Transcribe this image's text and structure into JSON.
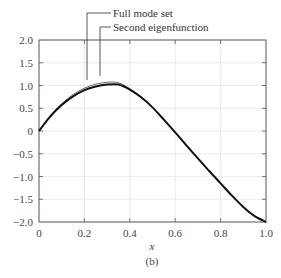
{
  "chart_data": {
    "type": "line",
    "title": "",
    "xlabel": "x",
    "ylabel": "",
    "caption": "(b)",
    "xlim": [
      0,
      1.0
    ],
    "ylim": [
      -2.0,
      2.0
    ],
    "grid": true,
    "x_ticks": [
      "0",
      "0.2",
      "0.4",
      "0.6",
      "0.8",
      "1.0"
    ],
    "y_ticks": [
      "2.0",
      "1.5",
      "1.0",
      "0.5",
      "0",
      "−0.5",
      "−1.0",
      "−1.5",
      "−2.0"
    ],
    "legend": {
      "position": "top-leader-lines",
      "entries": [
        "Full mode set",
        "Second eigenfunction"
      ]
    },
    "x": [
      0,
      0.05,
      0.1,
      0.15,
      0.2,
      0.25,
      0.3,
      0.35,
      0.4,
      0.45,
      0.5,
      0.55,
      0.6,
      0.65,
      0.7,
      0.75,
      0.8,
      0.85,
      0.9,
      0.95,
      1.0
    ],
    "series": [
      {
        "name": "Full mode set",
        "values": [
          0,
          0.34,
          0.6,
          0.8,
          0.94,
          1.03,
          1.07,
          1.06,
          0.93,
          0.75,
          0.52,
          0.25,
          -0.03,
          -0.32,
          -0.6,
          -0.88,
          -1.15,
          -1.42,
          -1.67,
          -1.87,
          -2.0
        ]
      },
      {
        "name": "Second eigenfunction",
        "values": [
          0,
          0.32,
          0.57,
          0.76,
          0.9,
          0.98,
          1.02,
          1.02,
          0.91,
          0.74,
          0.52,
          0.25,
          -0.03,
          -0.32,
          -0.6,
          -0.88,
          -1.15,
          -1.42,
          -1.67,
          -1.87,
          -2.0
        ]
      }
    ]
  }
}
